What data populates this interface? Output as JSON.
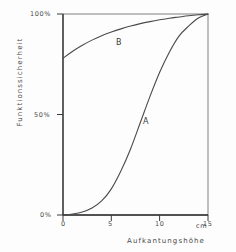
{
  "chart_data": {
    "type": "line",
    "title": "",
    "xlabel": "Aufkantungshöhe",
    "ylabel": "Funktionssicherheit",
    "x_unit": "cm",
    "xlim": [
      0,
      15
    ],
    "ylim": [
      0,
      100
    ],
    "grid": false,
    "legend_position": "inline-annotation",
    "x_ticks": [
      {
        "value": 0,
        "label": "0"
      },
      {
        "value": 5,
        "label": "5"
      },
      {
        "value": 10,
        "label": "10"
      },
      {
        "value": 15,
        "label": "15"
      }
    ],
    "y_ticks": [
      {
        "value": 0,
        "label": "0%"
      },
      {
        "value": 50,
        "label": "50%"
      },
      {
        "value": 100,
        "label": "100%"
      }
    ],
    "series": [
      {
        "name": "A",
        "annotation": "A",
        "x": [
          0,
          1,
          2,
          3,
          4,
          5,
          6,
          7,
          8,
          9,
          10,
          11,
          12,
          13,
          14,
          15
        ],
        "values": [
          0,
          0.5,
          1.5,
          3.5,
          7,
          13,
          22,
          33,
          46,
          59,
          71,
          81,
          89,
          94,
          98,
          100
        ]
      },
      {
        "name": "B",
        "annotation": "B",
        "x": [
          0,
          1,
          2,
          3,
          4,
          5,
          6,
          7,
          8,
          9,
          10,
          11,
          12,
          13,
          14,
          15
        ],
        "values": [
          78,
          81.5,
          84.5,
          87,
          89.2,
          91,
          92.6,
          94,
          95.2,
          96.2,
          97.1,
          97.9,
          98.5,
          99.1,
          99.6,
          100
        ]
      }
    ],
    "colors": {
      "axis": "#3a3a3a",
      "curve": "#4a4a4a",
      "background": "#fdfdfd",
      "text": "#4a4a4a"
    }
  }
}
